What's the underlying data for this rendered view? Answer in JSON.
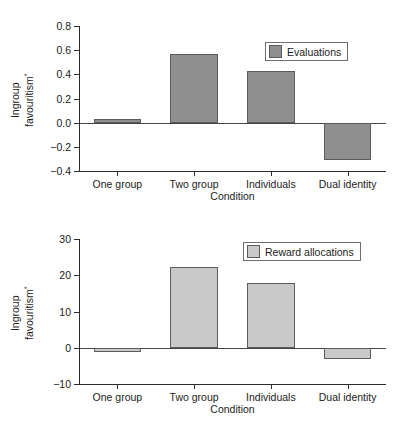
{
  "chart_data": [
    {
      "type": "bar",
      "id": "evaluations",
      "title": "",
      "xlabel": "Condition",
      "ylabel": "Ingroup favouritism",
      "ylabel_superscript": "*",
      "categories": [
        "One group",
        "Two group",
        "Individuals",
        "Dual identity"
      ],
      "values": [
        0.03,
        0.57,
        0.43,
        -0.31
      ],
      "series": [
        {
          "name": "Evaluations",
          "values": [
            0.03,
            0.57,
            0.43,
            -0.31
          ]
        }
      ],
      "ylim": [
        -0.4,
        0.8
      ],
      "yticks": [
        0.8,
        0.6,
        0.4,
        0.2,
        0.0,
        -0.2,
        -0.4
      ],
      "ytick_labels": [
        "0.8",
        "0.6",
        "0.4",
        "0.2",
        "0.0",
        "−0.2",
        "−0.4"
      ],
      "grid": false,
      "legend": {
        "position": "top-right",
        "entries": [
          "Evaluations"
        ]
      },
      "bar_color": "#8f8f8f",
      "bar_edge_color": "#5c5c5c"
    },
    {
      "type": "bar",
      "id": "reward-allocations",
      "title": "",
      "xlabel": "Condition",
      "ylabel": "Ingroup favouritism",
      "ylabel_superscript": "*",
      "categories": [
        "One group",
        "Two group",
        "Individuals",
        "Dual identity"
      ],
      "values": [
        -1.2,
        22.2,
        17.8,
        -3.1
      ],
      "series": [
        {
          "name": "Reward allocations",
          "values": [
            -1.2,
            22.2,
            17.8,
            -3.1
          ]
        }
      ],
      "ylim": [
        -10,
        30
      ],
      "yticks": [
        30,
        20,
        10,
        0,
        -10
      ],
      "ytick_labels": [
        "30",
        "20",
        "10",
        "0",
        "−10"
      ],
      "grid": false,
      "legend": {
        "position": "top-right",
        "entries": [
          "Reward allocations"
        ]
      },
      "bar_color": "#c9c9c9",
      "bar_edge_color": "#5c5c5c"
    }
  ]
}
